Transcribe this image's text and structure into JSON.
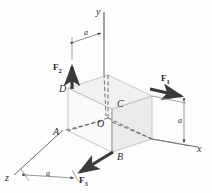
{
  "figure": {
    "type": "engineering-mechanics-diagram",
    "background_color": "#fdfdfd",
    "line_color": "#555555",
    "arrow_color": "#3a3a3a",
    "face_colors": {
      "top": "#f2f2f2",
      "left": "#fbfbfb",
      "right": "#ededed"
    }
  },
  "axes": [
    {
      "id": "y-axis",
      "label": "y",
      "direction": "up"
    },
    {
      "id": "x-axis",
      "label": "x",
      "direction": "right-down"
    },
    {
      "id": "z-axis",
      "label": "z",
      "direction": "left-down"
    }
  ],
  "points": [
    {
      "id": "point-O",
      "label": "O"
    },
    {
      "id": "point-A",
      "label": "A"
    },
    {
      "id": "point-B",
      "label": "B"
    },
    {
      "id": "point-C",
      "label": "C"
    },
    {
      "id": "point-D",
      "label": "D"
    }
  ],
  "forces": [
    {
      "id": "force-1",
      "label": "F",
      "subscript": "1",
      "at": "top right corner",
      "direction": "+x"
    },
    {
      "id": "force-2",
      "label": "F",
      "subscript": "2",
      "at": "D",
      "direction": "+y"
    },
    {
      "id": "force-3",
      "label": "F",
      "subscript": "3",
      "at": "B",
      "direction": "+z"
    }
  ],
  "dimensions": [
    {
      "id": "dim-top",
      "label": "a",
      "orientation": "horizontal-top"
    },
    {
      "id": "dim-right",
      "label": "a",
      "orientation": "vertical-right"
    },
    {
      "id": "dim-bottom",
      "label": "a",
      "orientation": "diagonal-bottom-left"
    }
  ]
}
